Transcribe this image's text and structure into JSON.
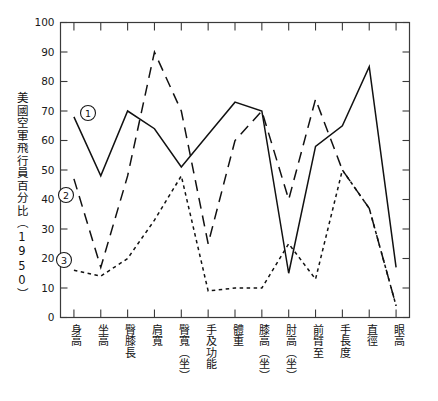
{
  "chart_data": {
    "type": "line",
    "title": "",
    "subtitle": "",
    "xlabel": "",
    "ylabel": "美國空軍飛行員百分比（1950）",
    "ylim": [
      0,
      100
    ],
    "ytick_step": 10,
    "yticks": [
      "0",
      "10",
      "20",
      "30",
      "40",
      "50",
      "60",
      "70",
      "80",
      "90",
      "100"
    ],
    "grid": false,
    "legend_position": "inline-annotations",
    "categories": [
      "身高",
      "坐高",
      "臀膝長",
      "肩寬",
      "臀寬（坐）",
      "手及功能",
      "體重",
      "膝高（坐）",
      "肘高（坐）",
      "前臂至",
      "手長度",
      "直徑",
      "眼高"
    ],
    "series": [
      {
        "name": "①",
        "style": "solid",
        "values": [
          68,
          48,
          70,
          64,
          51,
          62,
          73,
          70,
          15,
          58,
          65,
          85,
          17
        ]
      },
      {
        "name": "②",
        "style": "long-dash",
        "values": [
          47,
          17,
          48,
          90,
          70,
          25,
          60,
          70,
          40,
          74,
          50,
          37,
          4
        ]
      },
      {
        "name": "③",
        "style": "dotted",
        "values": [
          16,
          14,
          20,
          33,
          48,
          9,
          10,
          10,
          25,
          13,
          50,
          37,
          4
        ]
      }
    ],
    "annotations": [
      {
        "label": "①",
        "series": 0,
        "x_px": 88,
        "y_px": 113
      },
      {
        "label": "②",
        "series": 1,
        "x_px": 66,
        "y_px": 195
      },
      {
        "label": "③",
        "series": 2,
        "x_px": 64,
        "y_px": 260
      }
    ],
    "colors": {
      "series_1": "#111111",
      "series_2": "#111111",
      "series_3": "#111111",
      "axis": "#3a3a3a",
      "background": "#ffffff"
    }
  }
}
